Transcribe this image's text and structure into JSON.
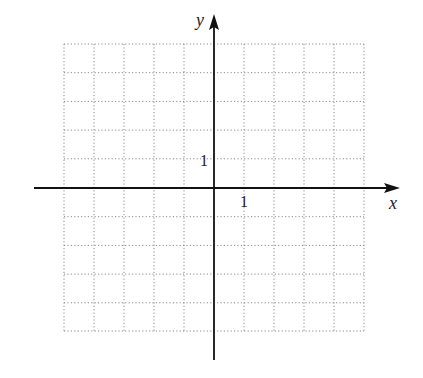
{
  "diagram": {
    "type": "coordinate-plane",
    "x_axis_label": "x",
    "y_axis_label": "y",
    "x_tick_label": "1",
    "y_tick_label": "1",
    "grid": {
      "x_min": -5,
      "x_max": 5,
      "y_min": -5,
      "y_max": 5,
      "style": "dotted"
    },
    "colors": {
      "axis": "#111111",
      "grid": "#888888",
      "background": "#ffffff"
    }
  }
}
